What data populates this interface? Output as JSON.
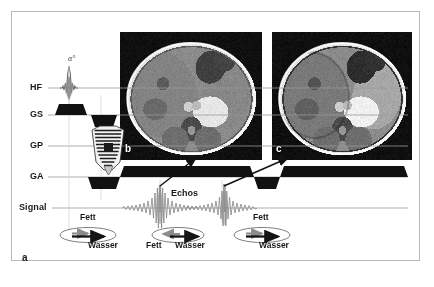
{
  "figure": {
    "panel_label_a": "a",
    "panel_label_b": "b",
    "panel_label_c": "c",
    "background_color": "#ffffff",
    "border_color": "#b9b9b9",
    "ink_color": "#1a1a1a",
    "fat_vector_color": "#8c8c8c",
    "water_vector_color": "#151515"
  },
  "sequence": {
    "axis_labels": [
      {
        "id": "hf",
        "text": "HF",
        "x": 30,
        "y": 82,
        "line_y": 88
      },
      {
        "id": "gs",
        "text": "GS",
        "x": 30,
        "y": 109,
        "line_y": 115
      },
      {
        "id": "gp",
        "text": "GP",
        "x": 30,
        "y": 140,
        "line_y": 146
      },
      {
        "id": "ga",
        "text": "GA",
        "x": 30,
        "y": 171,
        "line_y": 177
      },
      {
        "id": "signal",
        "text": "Signal",
        "x": 19,
        "y": 202,
        "line_y": 208
      }
    ],
    "flip_angle_label": "α°",
    "echoes_label": "Echos"
  },
  "vector_diagrams": [
    {
      "id": "vec-1",
      "cx": 88,
      "cy": 235,
      "fat_label": "Fett",
      "water_label": "Wasser",
      "fat_label_x": 80,
      "fat_label_y": 219,
      "water_label_x": 88,
      "water_label_y": 245,
      "fat_angle_deg": 0,
      "water_angle_deg": 0,
      "state": "in-phase"
    },
    {
      "id": "vec-2",
      "cx": 178,
      "cy": 235,
      "fat_label": "Fett",
      "water_label": "Wasser",
      "fat_label_x": 150,
      "fat_label_y": 245,
      "water_label_x": 184,
      "water_label_y": 245,
      "fat_angle_deg": 180,
      "water_angle_deg": 0,
      "state": "opposed-phase"
    },
    {
      "id": "vec-3",
      "cx": 262,
      "cy": 235,
      "fat_label": "Fett",
      "water_label": "Wasser",
      "fat_label_x": 258,
      "fat_label_y": 219,
      "water_label_x": 262,
      "water_label_y": 245,
      "fat_angle_deg": 0,
      "water_angle_deg": 0,
      "state": "in-phase"
    }
  ],
  "mri_images": [
    {
      "id": "mri-b",
      "label": "b",
      "x": 120,
      "y": 32,
      "w": 142,
      "h": 128,
      "caption_letter": "b",
      "description": "axial abdominal MR image, in-phase"
    },
    {
      "id": "mri-c",
      "label": "c",
      "x": 272,
      "y": 32,
      "w": 140,
      "h": 128,
      "caption_letter": "c",
      "description": "axial abdominal MR image, opposed-phase"
    }
  ]
}
